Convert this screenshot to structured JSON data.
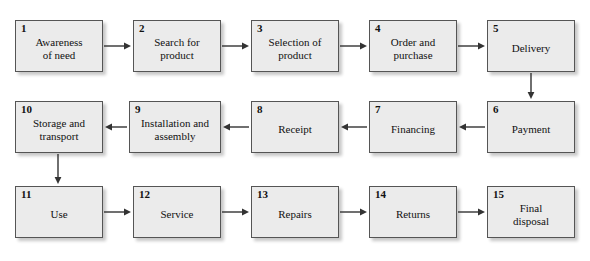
{
  "diagram": {
    "type": "flowchart",
    "flow_pattern": "serpentine",
    "colors": {
      "box_fill": "#ebebeb",
      "box_border": "#555555",
      "text": "#111111",
      "arrow": "#333333",
      "background": "#ffffff"
    },
    "nodes": [
      {
        "number": "1",
        "label": "Awareness\nof need",
        "x": 15,
        "y": 20,
        "w": 88,
        "h": 52,
        "row": 1
      },
      {
        "number": "2",
        "label": "Search for\nproduct",
        "x": 133,
        "y": 20,
        "w": 88,
        "h": 52,
        "row": 1
      },
      {
        "number": "3",
        "label": "Selection of\nproduct",
        "x": 251,
        "y": 20,
        "w": 88,
        "h": 52,
        "row": 1
      },
      {
        "number": "4",
        "label": "Order and\npurchase",
        "x": 369,
        "y": 20,
        "w": 88,
        "h": 52,
        "row": 1
      },
      {
        "number": "5",
        "label": "Delivery",
        "x": 487,
        "y": 20,
        "w": 88,
        "h": 52,
        "row": 1
      },
      {
        "number": "6",
        "label": "Payment",
        "x": 487,
        "y": 101,
        "w": 88,
        "h": 52,
        "row": 2
      },
      {
        "number": "7",
        "label": "Financing",
        "x": 369,
        "y": 101,
        "w": 88,
        "h": 52,
        "row": 2
      },
      {
        "number": "8",
        "label": "Receipt",
        "x": 251,
        "y": 101,
        "w": 88,
        "h": 52,
        "row": 2
      },
      {
        "number": "9",
        "label": "Installation and\nassembly",
        "x": 129,
        "y": 101,
        "w": 92,
        "h": 52,
        "row": 2
      },
      {
        "number": "10",
        "label": "Storage and\ntransport",
        "x": 15,
        "y": 101,
        "w": 88,
        "h": 52,
        "row": 2
      },
      {
        "number": "11",
        "label": "Use",
        "x": 15,
        "y": 186,
        "w": 88,
        "h": 52,
        "row": 3
      },
      {
        "number": "12",
        "label": "Service",
        "x": 133,
        "y": 186,
        "w": 88,
        "h": 52,
        "row": 3
      },
      {
        "number": "13",
        "label": "Repairs",
        "x": 251,
        "y": 186,
        "w": 88,
        "h": 52,
        "row": 3
      },
      {
        "number": "14",
        "label": "Returns",
        "x": 369,
        "y": 186,
        "w": 88,
        "h": 52,
        "row": 3
      },
      {
        "number": "15",
        "label": "Final\ndisposal",
        "x": 487,
        "y": 186,
        "w": 88,
        "h": 52,
        "row": 3
      }
    ],
    "connectors": [
      {
        "from": "1",
        "to": "2",
        "direction": "right",
        "x1": 104,
        "y1": 46,
        "x2": 131,
        "y2": 46
      },
      {
        "from": "2",
        "to": "3",
        "direction": "right",
        "x1": 222,
        "y1": 46,
        "x2": 249,
        "y2": 46
      },
      {
        "from": "3",
        "to": "4",
        "direction": "right",
        "x1": 340,
        "y1": 46,
        "x2": 367,
        "y2": 46
      },
      {
        "from": "4",
        "to": "5",
        "direction": "right",
        "x1": 458,
        "y1": 46,
        "x2": 485,
        "y2": 46
      },
      {
        "from": "5",
        "to": "6",
        "direction": "down",
        "x1": 531,
        "y1": 73,
        "x2": 531,
        "y2": 99
      },
      {
        "from": "6",
        "to": "7",
        "direction": "left",
        "x1": 485,
        "y1": 127,
        "x2": 459,
        "y2": 127
      },
      {
        "from": "7",
        "to": "8",
        "direction": "left",
        "x1": 367,
        "y1": 127,
        "x2": 341,
        "y2": 127
      },
      {
        "from": "8",
        "to": "9",
        "direction": "left",
        "x1": 249,
        "y1": 127,
        "x2": 223,
        "y2": 127
      },
      {
        "from": "9",
        "to": "10",
        "direction": "left",
        "x1": 127,
        "y1": 127,
        "x2": 105,
        "y2": 127
      },
      {
        "from": "10",
        "to": "11",
        "direction": "down",
        "x1": 58,
        "y1": 154,
        "x2": 58,
        "y2": 184
      },
      {
        "from": "11",
        "to": "12",
        "direction": "right",
        "x1": 104,
        "y1": 212,
        "x2": 131,
        "y2": 212
      },
      {
        "from": "12",
        "to": "13",
        "direction": "right",
        "x1": 222,
        "y1": 212,
        "x2": 249,
        "y2": 212
      },
      {
        "from": "13",
        "to": "14",
        "direction": "right",
        "x1": 340,
        "y1": 212,
        "x2": 367,
        "y2": 212
      },
      {
        "from": "14",
        "to": "15",
        "direction": "right",
        "x1": 458,
        "y1": 212,
        "x2": 485,
        "y2": 212
      }
    ]
  }
}
